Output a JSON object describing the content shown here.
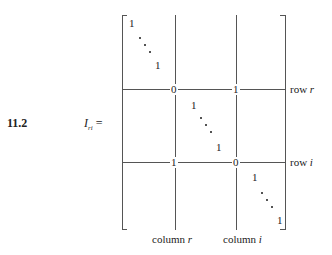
{
  "equation": {
    "number": "11.2",
    "lhs_symbol": "I",
    "lhs_subscript": "ri",
    "equals": "="
  },
  "matrix": {
    "top_left_block": {
      "first": "1",
      "last": "1"
    },
    "row_r": {
      "col_r_value": "0",
      "col_i_value": "1",
      "label_text": "row",
      "label_var": "r"
    },
    "middle_block": {
      "first": "1",
      "last": "1"
    },
    "row_i": {
      "col_r_value": "1",
      "col_i_value": "0",
      "label_text": "row",
      "label_var": "i"
    },
    "bottom_right_block": {
      "first": "1",
      "last": "1"
    },
    "column_labels": [
      {
        "text": "column",
        "var": "r"
      },
      {
        "text": "column",
        "var": "i"
      }
    ]
  }
}
